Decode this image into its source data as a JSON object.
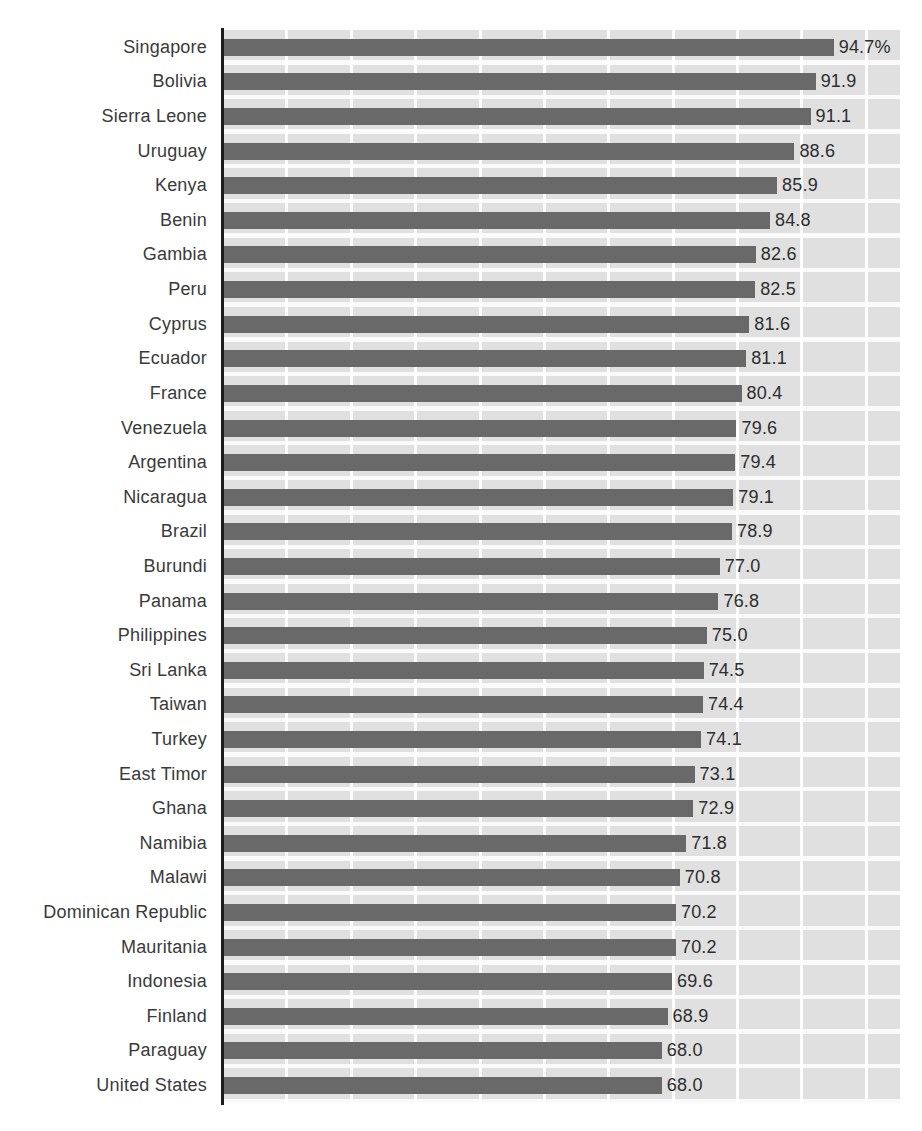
{
  "chart_data": {
    "type": "bar",
    "orientation": "horizontal",
    "title": "",
    "xlabel": "",
    "ylabel": "",
    "unit": "%",
    "xlim": [
      0,
      105
    ],
    "grid": "on",
    "gridline_interval": 10,
    "legend": "none",
    "categories": [
      "Singapore",
      "Bolivia",
      "Sierra Leone",
      "Uruguay",
      "Kenya",
      "Benin",
      "Gambia",
      "Peru",
      "Cyprus",
      "Ecuador",
      "France",
      "Venezuela",
      "Argentina",
      "Nicaragua",
      "Brazil",
      "Burundi",
      "Panama",
      "Philippines",
      "Sri Lanka",
      "Taiwan",
      "Turkey",
      "East Timor",
      "Ghana",
      "Namibia",
      "Malawi",
      "Dominican Republic",
      "Mauritania",
      "Indonesia",
      "Finland",
      "Paraguay",
      "United States"
    ],
    "values": [
      94.7,
      91.9,
      91.1,
      88.6,
      85.9,
      84.8,
      82.6,
      82.5,
      81.6,
      81.1,
      80.4,
      79.6,
      79.4,
      79.1,
      78.9,
      77.0,
      76.8,
      75.0,
      74.5,
      74.4,
      74.1,
      73.1,
      72.9,
      71.8,
      70.8,
      70.2,
      70.2,
      69.6,
      68.9,
      68.0,
      68.0
    ],
    "display_values": [
      "94.7%",
      "91.9",
      "91.1",
      "88.6",
      "85.9",
      "84.8",
      "82.6",
      "82.5",
      "81.6",
      "81.1",
      "80.4",
      "79.6",
      "79.4",
      "79.1",
      "78.9",
      "77.0",
      "76.8",
      "75.0",
      "74.5",
      "74.4",
      "74.1",
      "73.1",
      "72.9",
      "71.8",
      "70.8",
      "70.2",
      "70.2",
      "69.6",
      "68.9",
      "68.0",
      "68.0"
    ],
    "colors": {
      "bar": "#696969",
      "plot_background": "#e0e0e0",
      "gridline": "#ffffff",
      "axis_line": "#1c1c1c",
      "label_text": "#3a3a3a",
      "value_text": "#2e2e2e",
      "page_background": "#ffffff"
    }
  }
}
